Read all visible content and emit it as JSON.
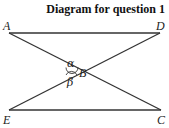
{
  "title": "Diagram for question 1",
  "points": {
    "A": {
      "label": "A"
    },
    "B": {
      "label": "B"
    },
    "C": {
      "label": "C"
    },
    "D": {
      "label": "D"
    },
    "E": {
      "label": "E"
    }
  },
  "angles": {
    "alpha": "α",
    "beta": "β"
  },
  "segments": [
    "AD",
    "AC",
    "DE",
    "EC"
  ],
  "colors": {
    "line": "#333333",
    "text": "#222222"
  }
}
